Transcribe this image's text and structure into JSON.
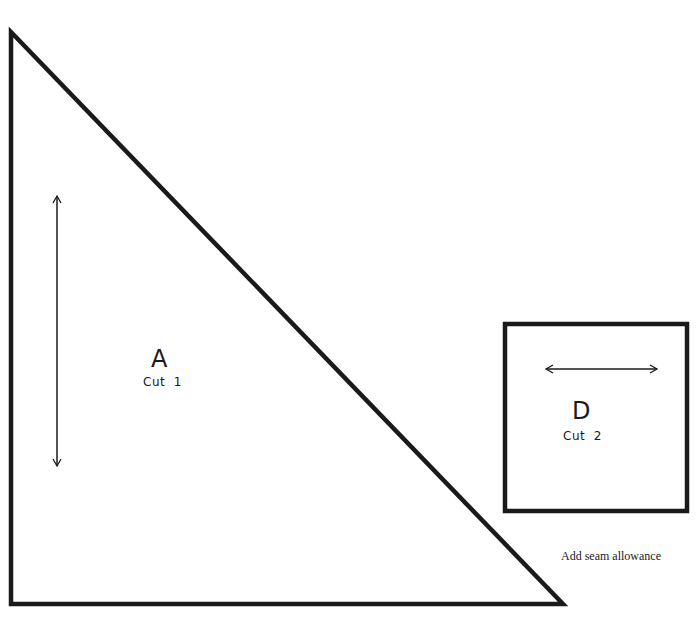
{
  "pieces": [
    {
      "id": "A",
      "shape": "right-triangle",
      "letter": "A",
      "cut_label": "Cut  1",
      "grainline": "vertical"
    },
    {
      "id": "D",
      "shape": "square",
      "letter": "D",
      "cut_label": "Cut  2",
      "grainline": "horizontal"
    }
  ],
  "note": "Add seam allowance",
  "colors": {
    "outline": "#1a1a1a",
    "background": "#ffffff"
  }
}
